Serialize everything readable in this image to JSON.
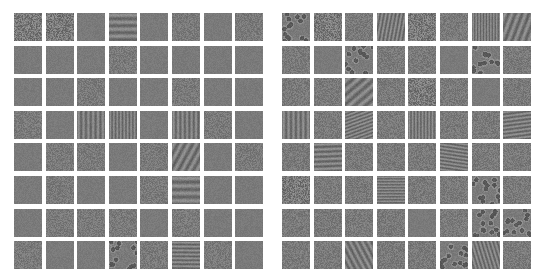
{
  "panels": [
    {
      "name": "left-filter-grid",
      "rows": 8,
      "cols": 8,
      "base_gray": "#7a7a7a",
      "tiles": [
        "noise-strong",
        "noise-strong",
        "flat",
        "stripes-h",
        "flat",
        "noise",
        "flat",
        "noise",
        "flat",
        "flat",
        "flat",
        "noise",
        "flat",
        "flat",
        "flat",
        "flat",
        "flat",
        "flat",
        "noise",
        "flat",
        "flat",
        "noise",
        "flat",
        "flat",
        "noise",
        "flat",
        "stripes-v",
        "stripes-v",
        "flat",
        "stripes-v",
        "noise",
        "flat",
        "flat",
        "noise",
        "noise",
        "flat",
        "noise",
        "stripes-d",
        "flat",
        "noise",
        "flat",
        "noise",
        "flat",
        "flat",
        "noise",
        "stripes-h",
        "flat",
        "flat",
        "flat",
        "noise",
        "noise",
        "noise",
        "flat",
        "noise",
        "flat",
        "flat",
        "noise",
        "flat",
        "flat",
        "blobs",
        "noise",
        "stripes-d",
        "noise",
        "flat"
      ]
    },
    {
      "name": "right-filter-grid",
      "rows": 8,
      "cols": 8,
      "base_gray": "#7a7a7a",
      "tiles": [
        "blobs",
        "noise-strong",
        "noise",
        "stripes-d",
        "noise-strong",
        "noise",
        "stripes-v",
        "stripes-d",
        "noise",
        "flat",
        "blobs",
        "noise",
        "noise",
        "flat",
        "blobs",
        "noise",
        "noise",
        "noise",
        "stripes-d",
        "noise",
        "noise-strong",
        "noise",
        "flat",
        "noise",
        "stripes-v",
        "noise",
        "stripes-d",
        "noise",
        "stripes-v",
        "noise",
        "noise",
        "stripes-d",
        "noise",
        "stripes-d",
        "noise",
        "noise",
        "noise",
        "stripes-d",
        "noise",
        "noise",
        "noise-strong",
        "noise",
        "noise",
        "stripes-h",
        "noise",
        "noise",
        "blobs",
        "noise",
        "noise",
        "noise",
        "noise",
        "noise",
        "flat",
        "noise",
        "blobs",
        "blobs",
        "noise",
        "noise",
        "stripes-d",
        "noise",
        "noise",
        "blobs",
        "stripes-d",
        "noise"
      ]
    }
  ]
}
